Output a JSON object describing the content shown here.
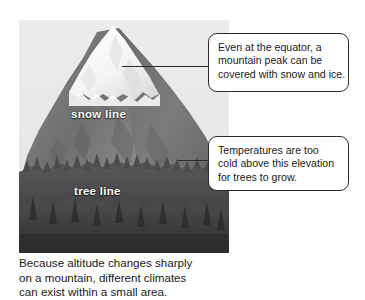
{
  "figure": {
    "photo": {
      "alt_name": "mountain-with-snow-and-tree-lines",
      "sky_color": "#e9e9e9",
      "snow_color": "#fdfdfd",
      "rock_color": "#7d7d7d",
      "forest_color": "#4a4a4a",
      "labels": {
        "snow_line": "snow line",
        "tree_line": "tree line"
      }
    },
    "caption": {
      "line1": "Because altitude changes sharply",
      "line2": "on a mountain, different climates",
      "line3": "can exist within a small area."
    }
  },
  "callouts": [
    {
      "id": "peak",
      "line1": "Even at the equator, a",
      "line2": "mountain peak can be",
      "line3": "covered with snow and ice.",
      "border_color": "#2b2b2b"
    },
    {
      "id": "treeline",
      "line1": "Temperatures are too",
      "line2": "cold above this elevation",
      "line3": "for trees to grow.",
      "border_color": "#2b2b2b"
    }
  ]
}
